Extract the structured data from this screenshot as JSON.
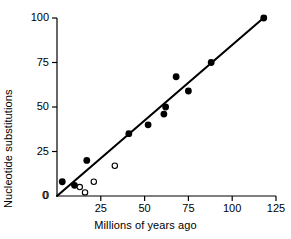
{
  "chart_data": {
    "type": "scatter",
    "title": "",
    "xlabel": "Millions of years ago",
    "ylabel": "Nucleotide substitutions",
    "xlim": [
      0,
      125
    ],
    "ylim": [
      0,
      100
    ],
    "xticks": [
      0,
      25,
      50,
      75,
      100,
      125
    ],
    "yticks": [
      0,
      25,
      50,
      75,
      100
    ],
    "xtick_labels": [
      "0",
      "25",
      "50",
      "75",
      "100",
      "125"
    ],
    "ytick_labels": [
      "0",
      "25",
      "50",
      "75",
      "100"
    ],
    "grid": false,
    "legend": null,
    "series": [
      {
        "name": "filled-points",
        "marker": "filled-circle",
        "color": "#000000",
        "points": [
          {
            "x": 3,
            "y": 8
          },
          {
            "x": 10,
            "y": 6
          },
          {
            "x": 17,
            "y": 20
          },
          {
            "x": 41,
            "y": 35
          },
          {
            "x": 52,
            "y": 40
          },
          {
            "x": 61,
            "y": 46
          },
          {
            "x": 62,
            "y": 50
          },
          {
            "x": 68,
            "y": 67
          },
          {
            "x": 75,
            "y": 59
          },
          {
            "x": 88,
            "y": 75
          },
          {
            "x": 118,
            "y": 100
          }
        ]
      },
      {
        "name": "open-points",
        "marker": "open-circle",
        "color": "#000000",
        "points": [
          {
            "x": 13,
            "y": 5
          },
          {
            "x": 16,
            "y": 2
          },
          {
            "x": 21,
            "y": 8
          },
          {
            "x": 33,
            "y": 17
          }
        ]
      }
    ],
    "fit_line": {
      "name": "regression-line",
      "x_start": 0,
      "y_start": 0,
      "x_end": 119,
      "y_end": 101,
      "color": "#000000"
    }
  }
}
